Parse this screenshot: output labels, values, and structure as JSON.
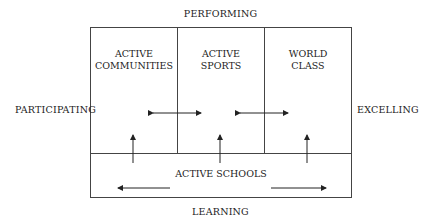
{
  "axes": {
    "top": "PERFORMING",
    "bottom": "LEARNING",
    "left": "PARTICIPATING",
    "right": "EXCELLING"
  },
  "cells": {
    "community": {
      "line1": "ACTIVE",
      "line2": "COMMUNITIES"
    },
    "sports": {
      "line1": "ACTIVE",
      "line2": "SPORTS"
    },
    "world": {
      "line1": "WORLD",
      "line2": "CLASS"
    },
    "schools": {
      "label": "ACTIVE SCHOOLS"
    }
  },
  "colors": {
    "line": "#333333",
    "text": "#222222"
  }
}
